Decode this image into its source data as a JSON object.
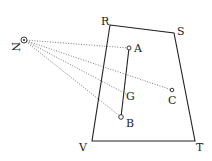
{
  "diagram": {
    "type": "geometric-figure",
    "colors": {
      "ink": "#222222",
      "background": "#ffffff",
      "dotted": "#555555"
    },
    "viewpoint": {
      "label": "N",
      "x": 24,
      "y": 40,
      "label_x": 17,
      "label_y": 44
    },
    "quadrilateral": {
      "vertices": [
        {
          "label": "R",
          "x": 110,
          "y": 25,
          "label_x": 101,
          "label_y": 25
        },
        {
          "label": "S",
          "x": 174,
          "y": 33,
          "label_x": 177,
          "label_y": 35
        },
        {
          "label": "T",
          "x": 195,
          "y": 141,
          "label_x": 196,
          "label_y": 151
        },
        {
          "label": "V",
          "x": 92,
          "y": 141,
          "label_x": 79,
          "label_y": 151
        }
      ]
    },
    "points": [
      {
        "label": "A",
        "x": 129,
        "y": 48,
        "label_x": 134,
        "label_y": 52
      },
      {
        "label": "G",
        "x": 126,
        "y": 94,
        "label_x": 126,
        "label_y": 100
      },
      {
        "label": "B",
        "x": 121,
        "y": 117,
        "label_x": 126,
        "label_y": 127
      },
      {
        "label": "C",
        "x": 172,
        "y": 90,
        "label_x": 168,
        "label_y": 104
      }
    ],
    "segment": {
      "from": "A",
      "to": "B"
    },
    "rays_from_N": [
      "A",
      "C",
      "G",
      "B"
    ]
  }
}
